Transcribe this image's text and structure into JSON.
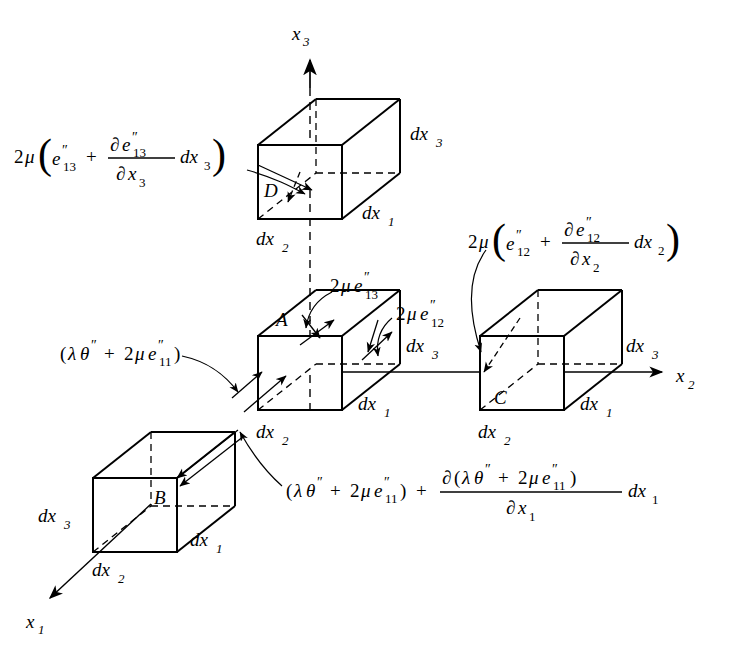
{
  "figure": {
    "background_color": "#ffffff",
    "line_color": "#000000",
    "axes": [
      {
        "name": "x3-axis",
        "label_base": "x",
        "label_sub": "3",
        "direction": "up",
        "label_x": 300,
        "label_y": 34,
        "line": {
          "x1": 310,
          "y1": 62,
          "x2": 310,
          "y2": 88
        }
      },
      {
        "name": "x2-axis",
        "label_base": "x",
        "label_sub": "2",
        "direction": "right",
        "label_x": 690,
        "label_y": 380,
        "line": {
          "x1": 562,
          "y1": 372,
          "x2": 668,
          "y2": 372
        }
      },
      {
        "name": "x1-axis",
        "label_base": "x",
        "label_sub": "1",
        "direction": "down-left",
        "label_x": 34,
        "label_y": 622,
        "line": {
          "x1": 108,
          "y1": 546,
          "x2": 48,
          "y2": 600
        }
      }
    ],
    "cubes": [
      {
        "id": "D",
        "name": "cube-D",
        "letter": "D",
        "letter_x": 268,
        "letter_y": 196,
        "front": {
          "x": 258,
          "y": 145,
          "w": 84,
          "h": 74
        },
        "depth_dx": 58,
        "depth_dy": -46,
        "edge_labels": [
          {
            "base": "dx",
            "sub": "3",
            "x": 418,
            "y": 140
          },
          {
            "base": "dx",
            "sub": "1",
            "x": 368,
            "y": 218
          },
          {
            "base": "dx",
            "sub": "2",
            "x": 262,
            "y": 243
          }
        ]
      },
      {
        "id": "A",
        "name": "cube-A",
        "letter": "A",
        "letter_x": 282,
        "letter_y": 324,
        "front": {
          "x": 258,
          "y": 336,
          "w": 84,
          "h": 74
        },
        "depth_dx": 58,
        "depth_dy": -46,
        "edge_labels": [
          {
            "base": "dx",
            "sub": "3",
            "x": 412,
            "y": 352
          },
          {
            "base": "dx",
            "sub": "1",
            "x": 364,
            "y": 410
          },
          {
            "base": "dx",
            "sub": "2",
            "x": 262,
            "y": 436
          }
        ]
      },
      {
        "id": "C",
        "name": "cube-C",
        "letter": "C",
        "letter_x": 500,
        "letter_y": 402,
        "front": {
          "x": 480,
          "y": 336,
          "w": 84,
          "h": 74
        },
        "depth_dx": 58,
        "depth_dy": -46,
        "edge_labels": [
          {
            "base": "dx",
            "sub": "3",
            "x": 630,
            "y": 352
          },
          {
            "base": "dx",
            "sub": "1",
            "x": 586,
            "y": 410
          },
          {
            "base": "dx",
            "sub": "2",
            "x": 484,
            "y": 436
          }
        ]
      },
      {
        "id": "B",
        "name": "cube-B",
        "letter": "B",
        "letter_x": 160,
        "letter_y": 502,
        "front": {
          "x": 93,
          "y": 478,
          "w": 84,
          "h": 74
        },
        "depth_dx": 58,
        "depth_dy": -46,
        "edge_labels": [
          {
            "base": "dx",
            "sub": "3",
            "x": 46,
            "y": 520
          },
          {
            "base": "dx",
            "sub": "1",
            "x": 198,
            "y": 545
          },
          {
            "base": "dx",
            "sub": "2",
            "x": 98,
            "y": 573
          }
        ]
      }
    ],
    "formulas": [
      {
        "name": "formula-shear-13-gradient",
        "x": 16,
        "y": 158,
        "text": "2μ( e″₁₃ + ∂e″₁₃/∂x₃ dx₃ )",
        "parts": {
          "coef": "2",
          "mu": "μ",
          "term1_base": "e",
          "term1_primes": "″",
          "term1_sub": "13",
          "plus": "+",
          "num_d": "∂",
          "num_base": "e",
          "num_primes": "″",
          "num_sub": "13",
          "den_d": "∂",
          "den_base": "x",
          "den_sub": "3",
          "tail_base": "dx",
          "tail_sub": "3"
        },
        "points_to": "cube-D"
      },
      {
        "name": "formula-shear-12-gradient",
        "x": 470,
        "y": 236,
        "text": "2μ( e″₁₂ + ∂e″₁₂/∂x₂ dx₂ )",
        "parts": {
          "coef": "2",
          "mu": "μ",
          "term1_base": "e",
          "term1_primes": "″",
          "term1_sub": "12",
          "plus": "+",
          "num_d": "∂",
          "num_base": "e",
          "num_primes": "″",
          "num_sub": "12",
          "den_d": "∂",
          "den_base": "x",
          "den_sub": "2",
          "tail_base": "dx",
          "tail_sub": "2"
        },
        "points_to": "cube-C"
      },
      {
        "name": "formula-shear-13",
        "x": 330,
        "y": 286,
        "text": "2μe″₁₃",
        "parts": {
          "coef": "2",
          "mu": "μ",
          "base": "e",
          "primes": "″",
          "sub": "13"
        },
        "points_to": "cube-A-top-face"
      },
      {
        "name": "formula-shear-12",
        "x": 395,
        "y": 313,
        "text": "2μe″₁₂",
        "parts": {
          "coef": "2",
          "mu": "μ",
          "base": "e",
          "primes": "″",
          "sub": "12"
        },
        "points_to": "cube-A-right-face"
      },
      {
        "name": "formula-normal-stress",
        "x": 62,
        "y": 352,
        "text": "(λθ″ + 2μe″₁₁)",
        "parts": {
          "open": "(",
          "lambda": "λ",
          "theta": "θ",
          "theta_primes": "″",
          "plus": "+",
          "coef": "2",
          "mu": "μ",
          "e_base": "e",
          "e_primes": "″",
          "e_sub": "11",
          "close": ")"
        },
        "points_to": "cube-A-left-face"
      },
      {
        "name": "formula-normal-stress-gradient",
        "x": 288,
        "y": 490,
        "text": "(λθ″ + 2μe″₁₁) + ∂(λθ″ + 2μe″₁₁)/∂x₁ dx₁",
        "parts": {
          "open": "(",
          "lambda": "λ",
          "theta": "θ",
          "theta_primes": "″",
          "plus1": "+",
          "coef1": "2",
          "mu1": "μ",
          "e_base1": "e",
          "e_primes1": "″",
          "e_sub1": "11",
          "close": ")",
          "plus2": "+",
          "num_d": "∂",
          "num_open": "(",
          "num_lambda": "λ",
          "num_theta": "θ",
          "num_theta_primes": "″",
          "num_plus": "+",
          "num_coef": "2",
          "num_mu": "μ",
          "num_e": "e",
          "num_e_primes": "″",
          "num_e_sub": "11",
          "num_close": ")",
          "den_d": "∂",
          "den_base": "x",
          "den_sub": "1",
          "tail_base": "dx",
          "tail_sub": "1"
        },
        "points_to": "cube-B"
      }
    ]
  }
}
